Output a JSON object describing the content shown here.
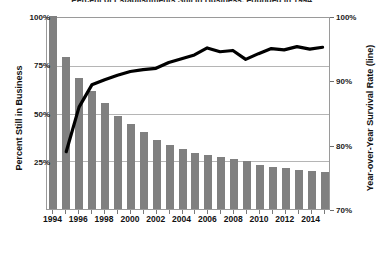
{
  "chart_data": {
    "type": "bar",
    "title": "Percent of Establishments Still in Business, Founded in 1994",
    "xlabel": "",
    "ylabel": "Percent Still in Business",
    "y2label": "Year-over-Year Survival Rate (line)",
    "grid": true,
    "legend_position": "none",
    "ylim": [
      0,
      100
    ],
    "y2lim": [
      70,
      100
    ],
    "yticks": [
      "25%",
      "50%",
      "75%",
      "100%"
    ],
    "ytick_values": [
      25,
      50,
      75,
      100
    ],
    "y2ticks": [
      "70%",
      "80%",
      "90%",
      "100%"
    ],
    "y2tick_values": [
      70,
      80,
      90,
      100
    ],
    "categories": [
      "1994",
      "1995",
      "1996",
      "1997",
      "1998",
      "1999",
      "2000",
      "2001",
      "2002",
      "2003",
      "2004",
      "2005",
      "2006",
      "2007",
      "2008",
      "2009",
      "2010",
      "2011",
      "2012",
      "2013",
      "2014",
      "2015"
    ],
    "xtick_labels": [
      "1994",
      "1996",
      "1998",
      "2000",
      "2002",
      "2004",
      "2006",
      "2008",
      "2010",
      "2012",
      "2014"
    ],
    "series": [
      {
        "name": "Percent Still in Business",
        "type": "bar",
        "axis": "left",
        "color": "#808080",
        "values": [
          100,
          79,
          68,
          61,
          55,
          48,
          44,
          40,
          36,
          33,
          31,
          29,
          28,
          27,
          26,
          25,
          23,
          22,
          21,
          20,
          19.5,
          19
        ]
      },
      {
        "name": "Year-over-Year Survival Rate (line)",
        "type": "line",
        "axis": "right",
        "color": "#000000",
        "values": [
          null,
          79.0,
          86.0,
          89.5,
          90.3,
          91.0,
          91.6,
          91.9,
          92.1,
          93.0,
          93.6,
          94.2,
          95.3,
          94.7,
          94.9,
          93.5,
          94.4,
          95.2,
          95.0,
          95.5,
          95.1,
          95.4
        ]
      }
    ]
  }
}
